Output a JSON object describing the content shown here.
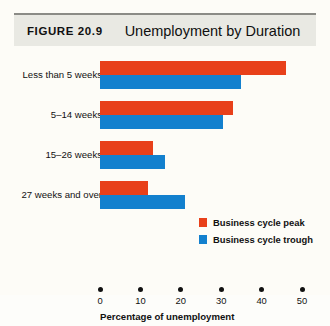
{
  "header": {
    "figure_label": "FIGURE 20.9",
    "title": "Unemployment by Duration"
  },
  "colors": {
    "peak": "#e8401a",
    "trough": "#1380ce",
    "header_band": "#e9e9e3",
    "header_rule": "#8b8b86",
    "page_background": "#fdfcf7"
  },
  "chart_data": {
    "type": "bar",
    "orientation": "horizontal",
    "title": "Unemployment by Duration",
    "xlabel": "Percentage of unemployment",
    "ylabel": "",
    "xlim": [
      0,
      50
    ],
    "xticks": [
      0,
      10,
      20,
      30,
      40,
      50
    ],
    "xtick_labels": [
      "0",
      "10",
      "20",
      "30",
      "40",
      "50"
    ],
    "grid": false,
    "legend_position": "middle-right",
    "categories": [
      "Less than 5 weeks",
      "5–14 weeks",
      "15–26 weeks",
      "27 weeks and over"
    ],
    "series": [
      {
        "name": "Business cycle peak",
        "color": "#e8401a",
        "values": [
          46,
          33,
          13,
          12
        ]
      },
      {
        "name": "Business cycle trough",
        "color": "#1380ce",
        "values": [
          35,
          30.5,
          16,
          21
        ]
      }
    ]
  }
}
